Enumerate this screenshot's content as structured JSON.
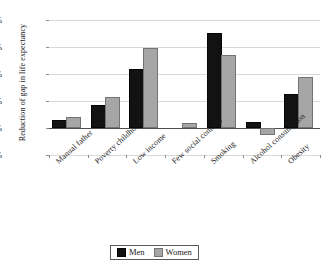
{
  "chart_data": {
    "type": "bar",
    "title": "",
    "xlabel": "",
    "ylabel": "Reduction of gap in life expectancy",
    "ylim": [
      -5,
      20
    ],
    "yunit": "%",
    "yticks": [
      20,
      15,
      10,
      5,
      0,
      -5
    ],
    "ytick_labels": [
      "20%",
      "15%",
      "10%",
      "5%",
      "0%",
      "-5%"
    ],
    "grid": "horizontal",
    "legend_position": "bottom-center",
    "categories": [
      "Manual father",
      "Poverty childhood",
      "Low income",
      "Few social contacts",
      "Smoking",
      "Alcohol consumption",
      "Obesity"
    ],
    "series": [
      {
        "name": "Men",
        "color": "#121212",
        "values": [
          1.5,
          4.3,
          10.9,
          0,
          17.6,
          1.1,
          6.3
        ]
      },
      {
        "name": "Women",
        "color": "#a6a6a6",
        "values": [
          2.0,
          5.7,
          14.9,
          1.0,
          13.5,
          -1.3,
          9.5
        ]
      }
    ]
  },
  "legend": {
    "entries": [
      {
        "label": "Men"
      },
      {
        "label": "Women"
      }
    ]
  }
}
